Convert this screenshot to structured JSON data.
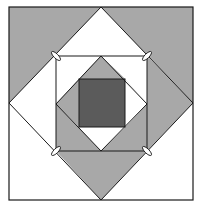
{
  "diagram": {
    "colors": {
      "background": "#ffffff",
      "gray": "#a8a8a8",
      "dark": "#5b5b5b",
      "stroke": "#1a1a1a",
      "marker_fill": "#ffffff"
    },
    "outer_square": {
      "x1": 9,
      "y1": 7,
      "x2": 193,
      "y2": 200
    },
    "big_diamond": {
      "top": [
        101,
        7
      ],
      "right": [
        193,
        103
      ],
      "bottom": [
        101,
        200
      ],
      "left": [
        9,
        103
      ]
    },
    "middle_square": {
      "x1": 56,
      "y1": 56,
      "x2": 147,
      "y2": 151
    },
    "inner_diamond": {
      "top": [
        101,
        56
      ],
      "right": [
        147,
        104
      ],
      "bottom": [
        101,
        151
      ],
      "left": [
        56,
        104
      ]
    },
    "dark_square": {
      "x1": 79,
      "y1": 79,
      "x2": 125,
      "y2": 127
    },
    "markers": [
      {
        "corner": "top-left",
        "x": 56,
        "y": 56,
        "angle": 45
      },
      {
        "corner": "top-right",
        "x": 147,
        "y": 56,
        "angle": -45
      },
      {
        "corner": "bottom-left",
        "x": 56,
        "y": 151,
        "angle": -45
      },
      {
        "corner": "bottom-right",
        "x": 147,
        "y": 151,
        "angle": 45
      }
    ]
  }
}
